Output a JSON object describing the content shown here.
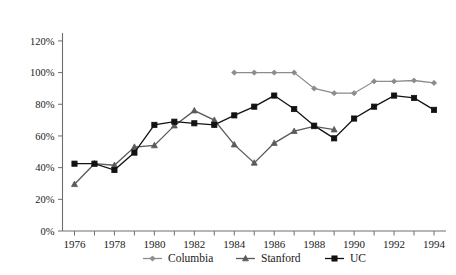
{
  "chart_data": {
    "type": "line",
    "title": "",
    "subtitle": "",
    "xlabel": "",
    "ylabel": "",
    "x": [
      1976,
      1977,
      1978,
      1979,
      1980,
      1981,
      1982,
      1983,
      1984,
      1985,
      1986,
      1987,
      1988,
      1989,
      1990,
      1991,
      1992,
      1993,
      1994
    ],
    "xlim": [
      1975.4,
      1994.6
    ],
    "ylim": [
      0,
      125
    ],
    "grid": false,
    "legend_position": "bottom",
    "y_tick_values": [
      0,
      20,
      40,
      60,
      80,
      100,
      120
    ],
    "y_tick_labels": [
      "0%",
      "20%",
      "40%",
      "60%",
      "80%",
      "100%",
      "120%"
    ],
    "x_tick_values": [
      1976,
      1977,
      1978,
      1979,
      1980,
      1981,
      1982,
      1983,
      1984,
      1985,
      1986,
      1987,
      1988,
      1989,
      1990,
      1991,
      1992,
      1993,
      1994
    ],
    "x_tick_labels": [
      "1976",
      "",
      "1978",
      "",
      "1980",
      "",
      "1982",
      "",
      "1984",
      "",
      "1986",
      "",
      "1988",
      "",
      "1990",
      "",
      "1992",
      "",
      "1994"
    ],
    "series": [
      {
        "name": "Columbia",
        "color": "#8c8c8c",
        "marker": "diamond",
        "x": [
          1984,
          1985,
          1986,
          1987,
          1988,
          1989,
          1990,
          1991,
          1992,
          1993,
          1994
        ],
        "values": [
          100,
          100,
          100,
          100,
          90,
          87,
          87,
          94.5,
          94.5,
          95,
          93.5
        ]
      },
      {
        "name": "Stanford",
        "color": "#5a5a5a",
        "marker": "triangle",
        "x": [
          1976,
          1977,
          1978,
          1979,
          1980,
          1981,
          1982,
          1983,
          1984,
          1985,
          1986,
          1987,
          1988,
          1989
        ],
        "values": [
          29.5,
          42.5,
          41.5,
          53,
          54,
          66.5,
          76,
          70,
          54.5,
          43,
          55.5,
          63,
          66,
          64
        ]
      },
      {
        "name": "UC",
        "color": "#121212",
        "marker": "square",
        "x": [
          1976,
          1977,
          1978,
          1979,
          1980,
          1981,
          1982,
          1983,
          1984,
          1985,
          1986,
          1987,
          1988,
          1989,
          1990,
          1991,
          1992,
          1993,
          1994
        ],
        "values": [
          42.5,
          42.5,
          38.5,
          49.5,
          67,
          69,
          68,
          67,
          73,
          78.5,
          85.5,
          77,
          66.5,
          58.5,
          71,
          78.5,
          85.5,
          84,
          76.5
        ]
      }
    ]
  },
  "legend": {
    "items": [
      {
        "label": "Columbia",
        "color": "#8c8c8c",
        "marker": "diamond"
      },
      {
        "label": "Stanford",
        "color": "#5a5a5a",
        "marker": "triangle"
      },
      {
        "label": "UC",
        "color": "#121212",
        "marker": "square"
      }
    ]
  }
}
